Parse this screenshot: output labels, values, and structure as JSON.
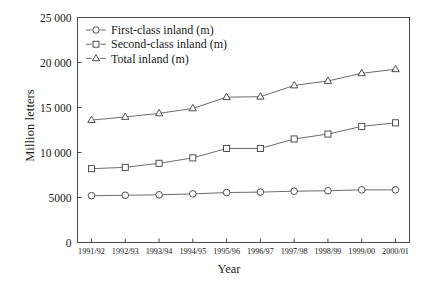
{
  "chart_data": {
    "type": "line",
    "title": "",
    "xlabel": "Year",
    "ylabel": "Million letters",
    "categories": [
      "1991/92",
      "1992/93",
      "1993/94",
      "1994/95",
      "1995/96",
      "1996/97",
      "1997/98",
      "1998/99",
      "1999/00",
      "2000/01"
    ],
    "series": [
      {
        "name": "First-class inland (m)",
        "marker": "circle",
        "values": [
          5200,
          5250,
          5300,
          5400,
          5550,
          5600,
          5700,
          5750,
          5850,
          5850
        ]
      },
      {
        "name": "Second-class inland (m)",
        "marker": "square",
        "values": [
          8200,
          8350,
          8800,
          9400,
          10450,
          10450,
          11500,
          12050,
          12900,
          13300
        ]
      },
      {
        "name": "Total inland (m)",
        "marker": "triangle",
        "values": [
          13600,
          13950,
          14350,
          14900,
          16150,
          16200,
          17450,
          17950,
          18800,
          19250
        ]
      }
    ],
    "ylim": [
      0,
      25000
    ],
    "yticks": [
      0,
      5000,
      10000,
      15000,
      20000,
      25000
    ],
    "ytick_labels": [
      "0",
      "5000",
      "10 000",
      "15 000",
      "20 000",
      "25 000"
    ],
    "grid": false,
    "legend_position": "top-left-inside",
    "line_color": "#5c5c5c",
    "marker_fill": "#ffffff",
    "marker_stroke": "#3d3d3d"
  },
  "axes": {
    "y_title": "Million letters",
    "x_title": "Year"
  },
  "legend": {
    "entries": [
      {
        "label": "First-class inland (m)",
        "marker": "circle"
      },
      {
        "label": "Second-class inland (m)",
        "marker": "square"
      },
      {
        "label": "Total inland (m)",
        "marker": "triangle"
      }
    ]
  }
}
